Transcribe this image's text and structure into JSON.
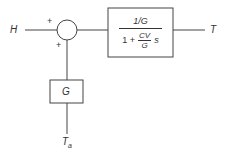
{
  "diagram": {
    "type": "block-diagram",
    "inputs": {
      "main": "H",
      "disturbance_main": "T",
      "disturbance_sub": "a"
    },
    "output": "T",
    "summing_junction": {
      "signs": [
        "+",
        "+"
      ]
    },
    "forward_block": {
      "numerator": "1/G",
      "denominator_prefix": "1 +",
      "inner_numerator": "CV",
      "inner_denominator": "G",
      "denominator_suffix": "s"
    },
    "feedforward_block": {
      "label": "G"
    }
  }
}
